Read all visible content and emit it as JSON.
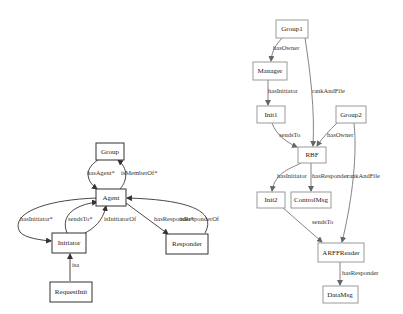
{
  "diagrams": [
    {
      "name": "ontology-schema",
      "nodes": [
        {
          "id": "Group",
          "label": "Group"
        },
        {
          "id": "Agent",
          "label": "Agent"
        },
        {
          "id": "Initiator",
          "label": "Initiator"
        },
        {
          "id": "Responder",
          "label": "Responder"
        },
        {
          "id": "RequestInit",
          "label": "RequestInit"
        }
      ],
      "edges": [
        {
          "from": "Group",
          "to": "Agent",
          "label": "hasAgent*"
        },
        {
          "from": "Agent",
          "to": "Group",
          "label": "isMemberOf*"
        },
        {
          "from": "Agent",
          "to": "Initiator",
          "label": "hasInitiator*"
        },
        {
          "from": "Initiator",
          "to": "Agent",
          "label": "sendsTo*"
        },
        {
          "from": "Initiator",
          "to": "Agent",
          "label": "isInitiatorOf"
        },
        {
          "from": "Agent",
          "to": "Responder",
          "label": "hasResponder*"
        },
        {
          "from": "Responder",
          "to": "Agent",
          "label": "isResponderOf"
        },
        {
          "from": "RequestInit",
          "to": "Initiator",
          "label": "isa"
        }
      ]
    },
    {
      "name": "instance-graph",
      "nodes": [
        {
          "id": "Group1",
          "label": "Group1"
        },
        {
          "id": "Manager",
          "label": "Manager"
        },
        {
          "id": "Init1",
          "label": "Init1"
        },
        {
          "id": "Group2",
          "label": "Group2"
        },
        {
          "id": "RBF",
          "label": "RBF"
        },
        {
          "id": "Init2",
          "label": "Init2"
        },
        {
          "id": "ControlMsg",
          "label": "ControlMsg"
        },
        {
          "id": "ARFFReader",
          "label": "ARFFReader"
        },
        {
          "id": "DataMsg",
          "label": "DataMsg"
        }
      ],
      "edges": [
        {
          "from": "Group1",
          "to": "Manager",
          "label": "hasOwner"
        },
        {
          "from": "Group1",
          "to": "RBF",
          "label": "rankAndFile"
        },
        {
          "from": "Manager",
          "to": "Init1",
          "label": "hasInitiator"
        },
        {
          "from": "Init1",
          "to": "RBF",
          "label": "sendsTo"
        },
        {
          "from": "Group2",
          "to": "RBF",
          "label": "hasOwner"
        },
        {
          "from": "Group2",
          "to": "ARFFReader",
          "label": "rankAndFile"
        },
        {
          "from": "RBF",
          "to": "Init2",
          "label": "hasInitiator"
        },
        {
          "from": "RBF",
          "to": "ControlMsg",
          "label": "hasResponder"
        },
        {
          "from": "Init2",
          "to": "ARFFReader",
          "label": "sendsTo"
        },
        {
          "from": "ARFFReader",
          "to": "DataMsg",
          "label": "hasResponder"
        }
      ]
    }
  ]
}
